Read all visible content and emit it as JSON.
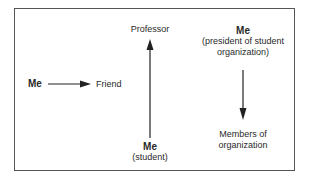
{
  "diagram": {
    "type": "relationship-diagram",
    "nodes": {
      "me_left": {
        "label": "Me"
      },
      "friend": {
        "label": "Friend"
      },
      "professor": {
        "label": "Professor"
      },
      "me_student": {
        "label": "Me",
        "sublabel": "(student)"
      },
      "me_president": {
        "label": "Me",
        "sublabel_line1": "(president of student",
        "sublabel_line2": "organization)"
      },
      "members": {
        "label_line1": "Members of",
        "label_line2": "organization"
      }
    },
    "edges": [
      {
        "from": "Me",
        "to": "Friend",
        "direction": "right"
      },
      {
        "from": "Me (student)",
        "to": "Professor",
        "direction": "up"
      },
      {
        "from": "Me (president of student organization)",
        "to": "Members of organization",
        "direction": "down"
      }
    ],
    "colors": {
      "line": "#222222",
      "border": "#555555"
    }
  }
}
